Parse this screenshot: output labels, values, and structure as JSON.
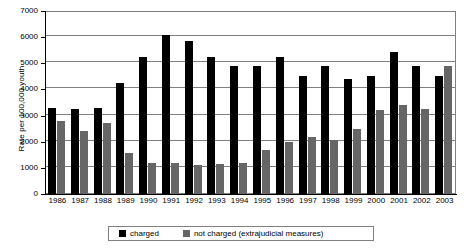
{
  "chart_data": {
    "type": "bar",
    "title": "",
    "xlabel": "",
    "ylabel": "Rate per 100,000 youth",
    "ylim": [
      0,
      7000
    ],
    "ytick_step": 1000,
    "yticks": [
      0,
      1000,
      2000,
      3000,
      4000,
      5000,
      6000,
      7000
    ],
    "ytick_labels": [
      "0",
      "1000",
      "2000",
      "3000",
      "4000",
      "5000",
      "6000",
      "7000"
    ],
    "grid": "horizontal",
    "legend_position": "bottom-center",
    "categories": [
      "1986",
      "1987",
      "1988",
      "1989",
      "1990",
      "1991",
      "1992",
      "1993",
      "1994",
      "1995",
      "1996",
      "1997",
      "1998",
      "1999",
      "2000",
      "2001",
      "2002",
      "2003"
    ],
    "series": [
      {
        "name": "charged",
        "color": "#000000",
        "values": [
          3300,
          3250,
          3300,
          4250,
          5250,
          6100,
          5850,
          5250,
          4900,
          4900,
          5250,
          4500,
          4900,
          4400,
          4500,
          5450,
          4900,
          4500
        ]
      },
      {
        "name": "not charged (extrajudicial measures)",
        "color": "#666666",
        "values": [
          2800,
          2400,
          2700,
          1550,
          1200,
          1200,
          1100,
          1150,
          1200,
          1700,
          2000,
          2200,
          2050,
          2500,
          3200,
          3400,
          3250,
          4900
        ]
      }
    ]
  },
  "legend": {
    "items": [
      {
        "label": "charged",
        "swatch": "black-square-swatch"
      },
      {
        "label": "not charged (extrajudicial measures)",
        "swatch": "gray-square-swatch"
      }
    ]
  }
}
